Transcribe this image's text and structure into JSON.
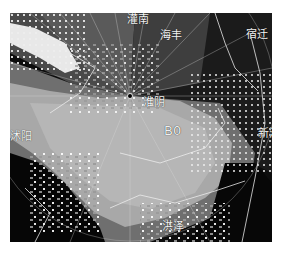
{
  "figure": {
    "type": "radar-reflectivity-ppi",
    "colormap": "grayscale",
    "background": "#ffffff",
    "frame": {
      "x": 10,
      "y": 13,
      "w": 262,
      "h": 229
    },
    "radar_center": {
      "x": 120,
      "y": 83
    },
    "colors": {
      "no_echo": "#0a0a0a",
      "weak": "#6e6e6e",
      "moderate": "#8f8f8f",
      "strong": "#b4b4b4",
      "very_strong": "#f2f2f2",
      "boundary_line": "#e8e8e8"
    }
  },
  "labels": [
    {
      "id": "label-top-left",
      "text": "灌南",
      "x": 117,
      "y": 1
    },
    {
      "id": "label-top",
      "text": "海丰",
      "x": 150,
      "y": 17
    },
    {
      "id": "label-top-right",
      "text": "宿迁",
      "x": 236,
      "y": 16
    },
    {
      "id": "label-center",
      "text": "淮阴",
      "x": 133,
      "y": 84
    },
    {
      "id": "label-echo",
      "text": "B0",
      "x": 154,
      "y": 111
    },
    {
      "id": "label-left",
      "text": "沭阳",
      "x": 0,
      "y": 118
    },
    {
      "id": "label-right",
      "text": "新沂",
      "x": 248,
      "y": 115
    },
    {
      "id": "label-bottom",
      "text": "洪泽",
      "x": 152,
      "y": 208
    }
  ]
}
